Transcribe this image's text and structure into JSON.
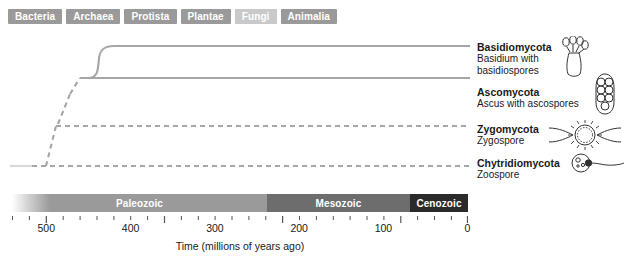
{
  "tabs": [
    {
      "label": "Bacteria",
      "active": false
    },
    {
      "label": "Archaea",
      "active": false
    },
    {
      "label": "Protista",
      "active": false
    },
    {
      "label": "Plantae",
      "active": false
    },
    {
      "label": "Fungi",
      "active": true
    },
    {
      "label": "Animalia",
      "active": false
    }
  ],
  "clades": [
    {
      "name": "Basidiomycota",
      "sub_line1": "Basidium with",
      "sub_line2": "basidiospores",
      "illustration": "basidium-icon",
      "line_style": "solid"
    },
    {
      "name": "Ascomycota",
      "sub_line1": "Ascus with ascospores",
      "sub_line2": "",
      "illustration": "ascus-icon",
      "line_style": "solid"
    },
    {
      "name": "Zygomycota",
      "sub_line1": "Zygospore",
      "sub_line2": "",
      "illustration": "zygospore-icon",
      "line_style": "dashed"
    },
    {
      "name": "Chytridiomycota",
      "sub_line1": "Zoospore",
      "sub_line2": "",
      "illustration": "zoospore-icon",
      "line_style": "dashed"
    }
  ],
  "timeline": {
    "caption": "Time (millions of years ago)",
    "eras": [
      {
        "label": "Paleozoic",
        "color": "#9a9a9a"
      },
      {
        "label": "Mesozoic",
        "color": "#6d6d6d"
      },
      {
        "label": "Cenozoic",
        "color": "#2b2b2b"
      }
    ],
    "tick_labels": [
      "500",
      "400",
      "300",
      "200",
      "100",
      "0"
    ]
  },
  "chart_data": {
    "type": "line",
    "xlabel": "Time (millions of years ago)",
    "ylabel": "",
    "xlim": [
      540,
      0
    ],
    "grid": false,
    "legend": "right-labels",
    "axis_ticks_major": [
      500,
      400,
      300,
      200,
      100,
      0
    ],
    "axis_tick_interval_minor": 20,
    "eras": [
      {
        "name": "Paleozoic",
        "start_mya": 542,
        "end_mya": 251
      },
      {
        "name": "Mesozoic",
        "start_mya": 251,
        "end_mya": 65
      },
      {
        "name": "Cenozoic",
        "start_mya": 65,
        "end_mya": 0
      }
    ],
    "series": [
      {
        "name": "Chytridiomycota",
        "divergence_mya": 530,
        "line_style": "dashed"
      },
      {
        "name": "Zygomycota",
        "divergence_mya": 518,
        "line_style": "dashed"
      },
      {
        "name": "Ascomycota",
        "divergence_mya": 505,
        "line_style": "solid"
      },
      {
        "name": "Basidiomycota",
        "divergence_mya": 490,
        "line_style": "solid"
      }
    ],
    "branch_points": [
      {
        "from": "root",
        "to": "Chytridiomycota",
        "mya": 530
      },
      {
        "from": "backbone",
        "to": "Zygomycota",
        "mya": 518
      },
      {
        "from": "backbone",
        "to": "Ascomycota+Basidiomycota",
        "mya": 505
      },
      {
        "from": "Ascomycota+Basidiomycota",
        "to": "Basidiomycota",
        "mya": 490
      }
    ]
  }
}
